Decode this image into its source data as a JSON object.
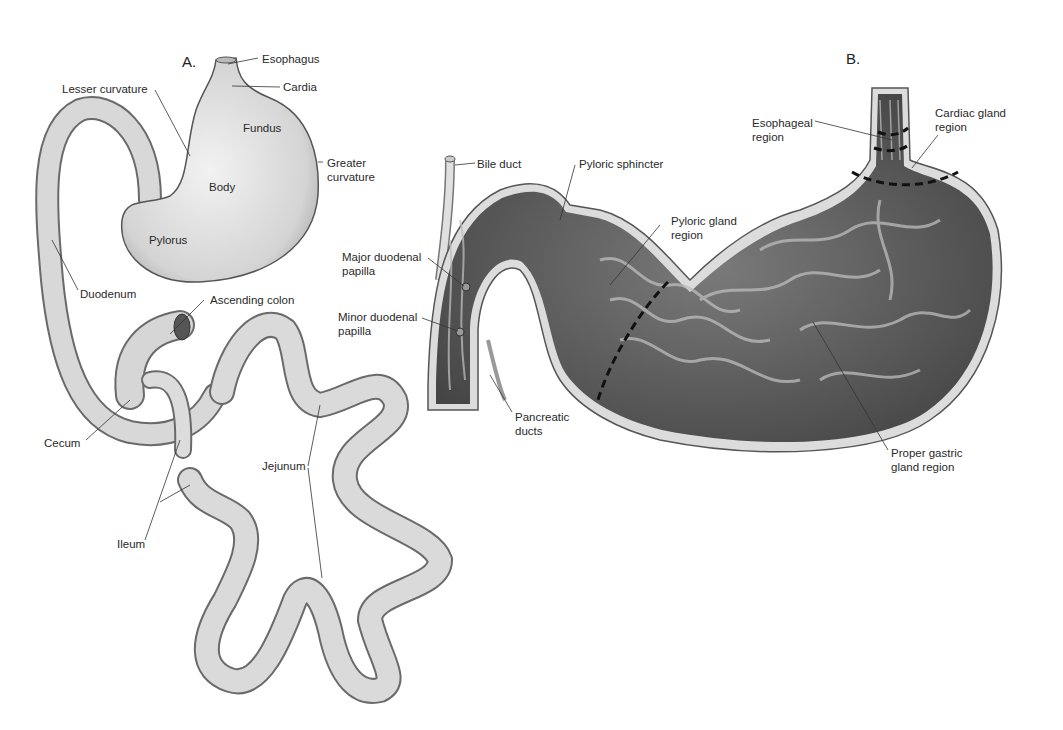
{
  "panels": {
    "a": {
      "letter": "A.",
      "labels": {
        "esophagus": "Esophagus",
        "cardia": "Cardia",
        "lesser_curvature": "Lesser curvature",
        "fundus": "Fundus",
        "greater_curvature_1": "Greater",
        "greater_curvature_2": "curvature",
        "body": "Body",
        "pylorus": "Pylorus",
        "duodenum": "Duodenum",
        "ascending_colon": "Ascending colon",
        "cecum": "Cecum",
        "jejunum": "Jejunum",
        "ileum": "Ileum"
      }
    },
    "b": {
      "letter": "B.",
      "labels": {
        "bile_duct": "Bile duct",
        "pyloric_sphincter": "Pyloric sphincter",
        "pyloric_gland_1": "Pyloric gland",
        "pyloric_gland_2": "region",
        "major_papilla_1": "Major duodenal",
        "major_papilla_2": "papilla",
        "minor_papilla_1": "Minor duodenal",
        "minor_papilla_2": "papilla",
        "pancreatic_ducts_1": "Pancreatic",
        "pancreatic_ducts_2": "ducts",
        "esophageal_region_1": "Esophageal",
        "esophageal_region_2": "region",
        "cardiac_gland_1": "Cardiac gland",
        "cardiac_gland_2": "region",
        "proper_gastric_1": "Proper gastric",
        "proper_gastric_2": "gland region"
      }
    }
  }
}
